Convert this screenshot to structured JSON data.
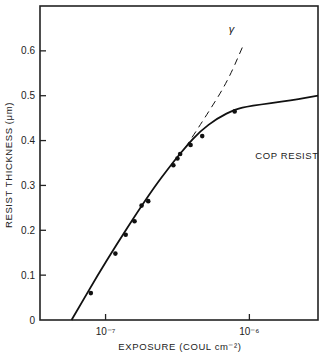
{
  "chart_data": {
    "type": "line",
    "title": "",
    "xlabel": "EXPOSURE (COUL cm⁻²)",
    "ylabel": "RESIST THICKNESS (μm)",
    "xscale": "log",
    "xlim": [
      3.5e-08,
      3e-06
    ],
    "ylim": [
      0,
      0.7
    ],
    "x_ticks": [
      {
        "value": 1e-07,
        "label": "10⁻⁷"
      },
      {
        "value": 1e-06,
        "label": "10⁻⁶"
      }
    ],
    "y_ticks": [
      {
        "value": 0,
        "label": "0"
      },
      {
        "value": 0.1,
        "label": "0.1"
      },
      {
        "value": 0.2,
        "label": "0.2"
      },
      {
        "value": 0.3,
        "label": "0.3"
      },
      {
        "value": 0.4,
        "label": "0.4"
      },
      {
        "value": 0.5,
        "label": "0.5"
      },
      {
        "value": 0.6,
        "label": "0.6"
      }
    ],
    "grid": false,
    "annotations": [
      {
        "text": "COP RESIST",
        "x": 1.1e-06,
        "y": 0.36
      },
      {
        "text": "γ",
        "x": 7.2e-07,
        "y": 0.64
      }
    ],
    "series": [
      {
        "name": "measured",
        "style": "scatter",
        "x": [
          7.9e-08,
          1.17e-07,
          1.38e-07,
          1.59e-07,
          1.78e-07,
          1.98e-07,
          2.96e-07,
          3.16e-07,
          3.3e-07,
          3.9e-07,
          4.7e-07,
          7.9e-07
        ],
        "y": [
          0.06,
          0.148,
          0.19,
          0.22,
          0.255,
          0.265,
          0.345,
          0.36,
          0.37,
          0.39,
          0.41,
          0.465
        ]
      },
      {
        "name": "fit curve",
        "style": "solid",
        "x": [
          5.8e-08,
          1e-07,
          2e-07,
          3e-07,
          3.6e-07,
          4.5e-07,
          6e-07,
          8e-07,
          1e-06,
          2e-06,
          3e-06
        ],
        "y": [
          0.0,
          0.13,
          0.28,
          0.355,
          0.385,
          0.42,
          0.45,
          0.47,
          0.477,
          0.49,
          0.5
        ]
      },
      {
        "name": "γ slope (extrapolation)",
        "style": "dashed",
        "x": [
          3.6e-07,
          5e-07,
          7e-07,
          9e-07
        ],
        "y": [
          0.385,
          0.455,
          0.53,
          0.61
        ]
      }
    ]
  }
}
